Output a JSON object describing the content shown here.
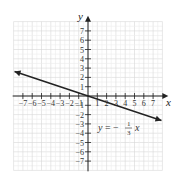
{
  "chart_data": {
    "type": "line",
    "title": "",
    "xlabel": "x",
    "ylabel": "y",
    "xlim": [
      -8,
      8
    ],
    "ylim": [
      -8,
      8
    ],
    "grid": true,
    "x_ticks": [
      -7,
      -6,
      -5,
      -4,
      -3,
      -2,
      -1,
      1,
      2,
      3,
      4,
      5,
      6,
      7
    ],
    "y_ticks": [
      7,
      6,
      5,
      4,
      3,
      2,
      1,
      -1,
      -2,
      -3,
      -4,
      -5,
      -6,
      -7
    ],
    "x_tick_labels": [
      "−7",
      "−6",
      "−5",
      "−4",
      "−3",
      "−2",
      "−1",
      "1",
      "2",
      "3",
      "4",
      "5",
      "6",
      "7"
    ],
    "y_tick_labels": [
      "7",
      "6",
      "5",
      "4",
      "3",
      "2",
      "1",
      "−1",
      "−2",
      "−3",
      "−4",
      "−5",
      "−6",
      "−7"
    ],
    "series": [
      {
        "name": "y = -1/3 x",
        "equation": "y = -(1/3)x",
        "slope": -0.3333,
        "intercept": 0,
        "x": [
          -8,
          -6,
          -3,
          0,
          3,
          6,
          8
        ],
        "y": [
          2.667,
          2,
          1,
          0,
          -1,
          -2,
          -2.667
        ],
        "arrows": "both"
      }
    ],
    "annotations": [
      {
        "text_prefix": "y = −",
        "numerator": "1",
        "denominator": "3",
        "suffix": "x",
        "x": 4,
        "y": -3.5
      }
    ]
  },
  "labels": {
    "x_axis": "x",
    "y_axis": "y",
    "eq_prefix_y": "y",
    "eq_equals": " = −",
    "eq_num": "1",
    "eq_den": "3",
    "eq_var": "x"
  }
}
